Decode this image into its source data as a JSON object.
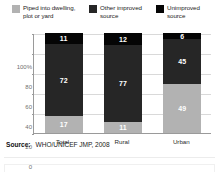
{
  "legend": {
    "items": [
      {
        "label": "Piped into dwelling,\nplot or yard",
        "color": "#b2b2b2",
        "swatch_icon": "legend-swatch-icon"
      },
      {
        "label": "Other improved\nsource",
        "color": "#262626",
        "swatch_icon": "legend-swatch-icon"
      },
      {
        "label": "Unimproved\nsource",
        "color": "#050505",
        "swatch_icon": "legend-swatch-icon"
      }
    ]
  },
  "axis": {
    "y_ticks": [
      "100%",
      "80",
      "60",
      "40",
      "20",
      "0"
    ],
    "y_values": [
      100,
      80,
      60,
      40,
      20,
      0
    ]
  },
  "source": {
    "label": "Source:",
    "value": "WHO/UNICEF JMP, 2008"
  },
  "chart_data": {
    "type": "bar",
    "stacked": true,
    "title": "",
    "subtitle": "",
    "xlabel": "",
    "ylabel": "",
    "ylim": [
      0,
      100
    ],
    "yticks": [
      0,
      20,
      40,
      60,
      80,
      100
    ],
    "ytick_labels": [
      "0",
      "20",
      "40",
      "60",
      "80",
      "100%"
    ],
    "grid": true,
    "legend_position": "top",
    "categories": [
      "Total",
      "Rural",
      "Urban"
    ],
    "series": [
      {
        "name": "Piped into dwelling, plot or yard",
        "color": "#b2b2b2",
        "label_color": "#ffffff",
        "values": [
          17,
          11,
          49
        ]
      },
      {
        "name": "Other improved source",
        "color": "#262626",
        "label_color": "#ffffff",
        "values": [
          72,
          77,
          45
        ]
      },
      {
        "name": "Unimproved source",
        "color": "#050505",
        "label_color": "#ffffff",
        "values": [
          11,
          12,
          6
        ]
      }
    ],
    "bars": [
      {
        "category": "Total",
        "segments": [
          {
            "series": "Unimproved source",
            "value": 11,
            "label": "11",
            "color": "#050505"
          },
          {
            "series": "Other improved source",
            "value": 72,
            "label": "72",
            "color": "#262626"
          },
          {
            "series": "Piped into dwelling, plot or yard",
            "value": 17,
            "label": "17",
            "color": "#b2b2b2"
          }
        ]
      },
      {
        "category": "Rural",
        "segments": [
          {
            "series": "Unimproved source",
            "value": 12,
            "label": "12",
            "color": "#050505"
          },
          {
            "series": "Other improved source",
            "value": 77,
            "label": "77",
            "color": "#262626"
          },
          {
            "series": "Piped into dwelling, plot or yard",
            "value": 11,
            "label": "11",
            "color": "#b2b2b2"
          }
        ]
      },
      {
        "category": "Urban",
        "segments": [
          {
            "series": "Unimproved source",
            "value": 6,
            "label": "6",
            "color": "#050505"
          },
          {
            "series": "Other improved source",
            "value": 45,
            "label": "45",
            "color": "#262626"
          },
          {
            "series": "Piped into dwelling, plot or yard",
            "value": 49,
            "label": "49",
            "color": "#b2b2b2"
          }
        ]
      }
    ]
  }
}
